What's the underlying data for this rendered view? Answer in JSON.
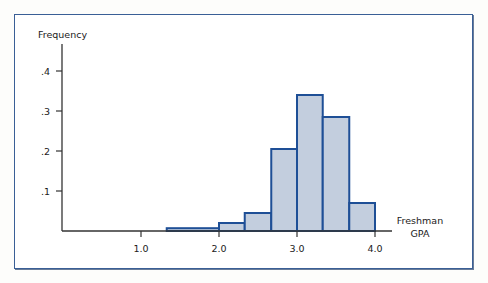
{
  "chart_data": {
    "type": "bar",
    "title": "",
    "xlabel": "Freshman GPA",
    "ylabel": "Frequency",
    "xlabel_lines": [
      "Freshman",
      "GPA"
    ],
    "x_ticks": [
      1.0,
      2.0,
      3.0,
      4.0
    ],
    "x_tick_labels": [
      "1.0",
      "2.0",
      "3.0",
      "4.0"
    ],
    "y_ticks": [
      0.1,
      0.2,
      0.3,
      0.4
    ],
    "y_tick_labels": [
      ".1",
      ".2",
      ".3",
      ".4"
    ],
    "xlim": [
      0.0,
      4.5
    ],
    "ylim": [
      0,
      0.45
    ],
    "grid": false,
    "legend": null,
    "bins": [
      {
        "x0": 1.33,
        "x1": 2.0,
        "value": 0.007
      },
      {
        "x0": 2.0,
        "x1": 2.33,
        "value": 0.02
      },
      {
        "x0": 2.33,
        "x1": 2.67,
        "value": 0.045
      },
      {
        "x0": 2.67,
        "x1": 3.0,
        "value": 0.205
      },
      {
        "x0": 3.0,
        "x1": 3.33,
        "value": 0.34
      },
      {
        "x0": 3.33,
        "x1": 3.67,
        "value": 0.285
      },
      {
        "x0": 3.67,
        "x1": 4.0,
        "value": 0.07
      }
    ],
    "categories": [
      "1.33-2.0",
      "2.0-2.33",
      "2.33-2.67",
      "2.67-3.0",
      "3.0-3.33",
      "3.33-3.67",
      "3.67-4.0"
    ],
    "values": [
      0.007,
      0.02,
      0.045,
      0.205,
      0.34,
      0.285,
      0.07
    ]
  },
  "colors": {
    "bar_fill": "#c3cede",
    "bar_stroke": "#1e4f96",
    "frame_border": "#3a5f96",
    "axis": "#333333"
  }
}
